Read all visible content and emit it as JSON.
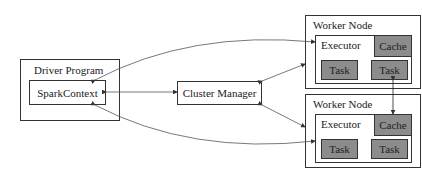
{
  "driver": {
    "title": "Driver Program",
    "context": "SparkContext"
  },
  "cluster_manager": {
    "label": "Cluster Manager"
  },
  "workers": [
    {
      "title": "Worker Node",
      "executor": "Executor",
      "cache": "Cache",
      "tasks": [
        "Task",
        "Task"
      ]
    },
    {
      "title": "Worker Node",
      "executor": "Executor",
      "cache": "Cache",
      "tasks": [
        "Task",
        "Task"
      ]
    }
  ]
}
